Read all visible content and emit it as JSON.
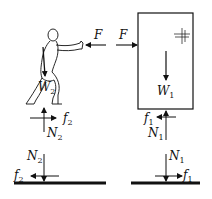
{
  "diagram": {
    "labels": {
      "force_person": "F",
      "force_box": "F",
      "weight_person": "W",
      "weight_person_sub": "2",
      "weight_box": "W",
      "weight_box_sub": "1",
      "friction_person_body": "f",
      "friction_person_body_sub": "2",
      "normal_person_body": "N",
      "normal_person_body_sub": "2",
      "friction_box_body": "f",
      "friction_box_body_sub": "1",
      "normal_box_body": "N",
      "normal_box_body_sub": "1",
      "normal_ground_left": "N",
      "normal_ground_left_sub": "2",
      "friction_ground_left": "f",
      "friction_ground_left_sub": "2",
      "normal_ground_right": "N",
      "normal_ground_right_sub": "1",
      "friction_ground_right": "f",
      "friction_ground_right_sub": "1"
    },
    "colors": {
      "ink": "#111111",
      "background": "#ffffff"
    }
  }
}
